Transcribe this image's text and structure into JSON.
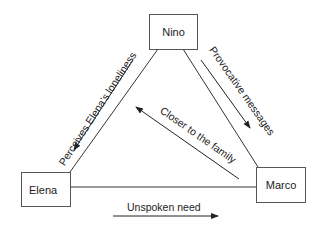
{
  "diagram": {
    "type": "triangle-relationship",
    "nodes": [
      {
        "id": "nino",
        "label": "Nino"
      },
      {
        "id": "elena",
        "label": "Elena"
      },
      {
        "id": "marco",
        "label": "Marco"
      }
    ],
    "edges": [
      {
        "from": "nino",
        "to": "elena",
        "label": "Perceives Elena’s loneliness",
        "direction": "nino-to-elena"
      },
      {
        "from": "nino",
        "to": "marco",
        "label": "Provocative messages",
        "direction": "nino-to-marco"
      },
      {
        "from": "marco",
        "to": "nino",
        "label": "Closer to the family",
        "direction": "marco-to-nino"
      },
      {
        "from": "elena",
        "to": "marco",
        "label": "Unspoken need",
        "direction": "elena-to-marco"
      }
    ],
    "colors": {
      "line": "#333333",
      "box_border": "#555555",
      "text": "#222222"
    }
  }
}
